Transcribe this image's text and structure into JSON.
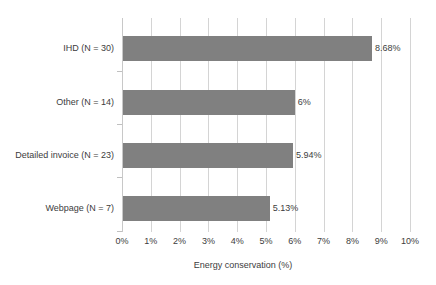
{
  "chart_data": {
    "type": "bar",
    "orientation": "horizontal",
    "title": "",
    "xlabel": "Energy conservation (%)",
    "ylabel": "",
    "xlim": [
      0,
      10
    ],
    "xticks": [
      "0%",
      "1%",
      "2%",
      "3%",
      "4%",
      "5%",
      "6%",
      "7%",
      "8%",
      "9%",
      "10%"
    ],
    "xtick_values": [
      0,
      1,
      2,
      3,
      4,
      5,
      6,
      7,
      8,
      9,
      10
    ],
    "grid": "vertical",
    "legend": "none",
    "bar_color": "#808080",
    "gridline_color": "#d4d4d4",
    "categories": [
      "IHD (N = 30)",
      "Other (N = 14)",
      "Detailed invoice (N = 23)",
      "Webpage (N = 7)"
    ],
    "values": [
      8.68,
      6,
      5.94,
      5.13
    ],
    "value_labels": [
      "8.68%",
      "6%",
      "5.94%",
      "5.13%"
    ]
  }
}
